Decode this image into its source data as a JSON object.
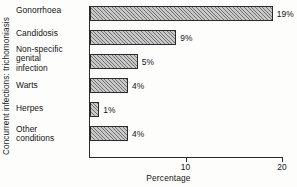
{
  "chart_data": {
    "type": "bar",
    "orientation": "horizontal",
    "title": "",
    "xlabel": "Percentage",
    "ylabel": "Concurrent infections: trichomoniasis",
    "categories": [
      "Gonorrhoea",
      "Candidosis",
      "Non-specific genital infection",
      "Warts",
      "Herpes",
      "Other conditions"
    ],
    "values": [
      19,
      9,
      5,
      4,
      1,
      4
    ],
    "value_labels": [
      "19%",
      "9%",
      "5%",
      "4%",
      "1%",
      "4%"
    ],
    "xlim": [
      0,
      20
    ],
    "xticks": [
      10,
      20
    ],
    "xtick_labels": [
      "10",
      "20"
    ],
    "grid": false,
    "legend": null,
    "bar_fill": "#c9c9c9",
    "bar_hatch": "diagonal-lines",
    "bar_edge_color": "#2b2b2b",
    "axis_color": "#2a2a2a"
  },
  "category_lines": [
    [
      "Gonorrhoea"
    ],
    [
      "Candidosis"
    ],
    [
      "Non-specific",
      "genital",
      "infection"
    ],
    [
      "Warts"
    ],
    [
      "Herpes"
    ],
    [
      "Other",
      "conditions"
    ]
  ]
}
